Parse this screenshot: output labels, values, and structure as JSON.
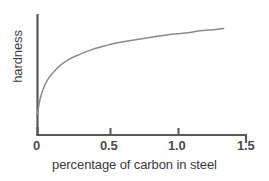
{
  "figure": {
    "background": "#ffffff",
    "width": 269,
    "height": 181
  },
  "chart_data": {
    "type": "line",
    "title": "",
    "xlabel": "percentage of carbon in steel",
    "ylabel": "hardness",
    "xlim": [
      0,
      1.5
    ],
    "ylim": [
      0,
      1
    ],
    "xticks": [
      0,
      0.5,
      1.0,
      1.5
    ],
    "xtick_labels": [
      "0",
      "0.5",
      "1.0",
      "1.5"
    ],
    "yticks": [],
    "ytick_labels": [],
    "grid": false,
    "legend": null,
    "axis_color": "#595959",
    "line_color": "#8a8a8a",
    "series": [
      {
        "name": "hardness",
        "x": [
          0.0,
          0.02,
          0.05,
          0.08,
          0.12,
          0.17,
          0.23,
          0.3,
          0.38,
          0.46,
          0.55,
          0.64,
          0.74,
          0.84,
          0.95,
          1.05,
          1.15,
          1.25,
          1.32
        ],
        "y": [
          0.19,
          0.33,
          0.44,
          0.51,
          0.57,
          0.63,
          0.68,
          0.72,
          0.76,
          0.79,
          0.82,
          0.84,
          0.86,
          0.88,
          0.9,
          0.91,
          0.93,
          0.94,
          0.95
        ]
      }
    ],
    "annotations": []
  },
  "axes": {
    "xaxis_label": "percentage of carbon in steel",
    "yaxis_label": "hardness",
    "tick_labels": {
      "t0": "0",
      "t05": "0.5",
      "t10": "1.0",
      "t15": "1.5"
    }
  }
}
